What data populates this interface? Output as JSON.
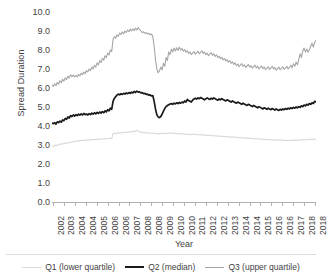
{
  "chart_data": {
    "type": "line",
    "title": "",
    "xlabel": "Year",
    "ylabel": "Spread Duration",
    "ylim": [
      0.0,
      10.0
    ],
    "ytick_labels": [
      "0.0",
      "1.0",
      "2.0",
      "3.0",
      "4.0",
      "5.0",
      "6.0",
      "7.0",
      "8.0",
      "9.0",
      "10.0"
    ],
    "ytick_values": [
      0.0,
      1.0,
      2.0,
      3.0,
      4.0,
      5.0,
      6.0,
      7.0,
      8.0,
      9.0,
      10.0
    ],
    "grid": false,
    "legend_position": "bottom",
    "xtick_labels": [
      "2002",
      "2003",
      "2004",
      "2004",
      "2005",
      "2006",
      "2006",
      "2007",
      "2008",
      "2008",
      "2009",
      "2010",
      "2010",
      "2011",
      "2012",
      "2012",
      "2013",
      "2014",
      "2014",
      "2015",
      "2016",
      "2016",
      "2017",
      "2018",
      "2018"
    ],
    "x_start": 2002.0,
    "x_end": 2018.6,
    "series": [
      {
        "name": "Q1 (lower quartile)",
        "color": "#d9d9d9",
        "width": 1.1,
        "values": [
          2.95,
          2.92,
          2.96,
          3.0,
          2.98,
          3.02,
          3.05,
          3.03,
          3.08,
          3.06,
          3.1,
          3.12,
          3.09,
          3.14,
          3.16,
          3.13,
          3.18,
          3.2,
          3.17,
          3.22,
          3.24,
          3.21,
          3.25,
          3.23,
          3.26,
          3.24,
          3.27,
          3.25,
          3.28,
          3.26,
          3.29,
          3.27,
          3.3,
          3.28,
          3.31,
          3.29,
          3.32,
          3.3,
          3.33,
          3.31,
          3.34,
          3.32,
          3.35,
          3.33,
          3.36,
          3.34,
          3.6,
          3.62,
          3.59,
          3.63,
          3.65,
          3.62,
          3.66,
          3.64,
          3.67,
          3.65,
          3.68,
          3.66,
          3.7,
          3.67,
          3.72,
          3.69,
          3.74,
          3.71,
          3.78,
          3.74,
          3.7,
          3.66,
          3.68,
          3.64,
          3.66,
          3.63,
          3.65,
          3.62,
          3.64,
          3.61,
          3.63,
          3.6,
          3.62,
          3.59,
          3.61,
          3.58,
          3.6,
          3.62,
          3.59,
          3.61,
          3.63,
          3.6,
          3.62,
          3.64,
          3.61,
          3.63,
          3.6,
          3.62,
          3.59,
          3.61,
          3.58,
          3.6,
          3.57,
          3.59,
          3.56,
          3.58,
          3.55,
          3.57,
          3.54,
          3.56,
          3.58,
          3.55,
          3.57,
          3.54,
          3.56,
          3.53,
          3.55,
          3.52,
          3.54,
          3.51,
          3.53,
          3.5,
          3.52,
          3.49,
          3.51,
          3.48,
          3.5,
          3.47,
          3.49,
          3.46,
          3.48,
          3.45,
          3.47,
          3.44,
          3.46,
          3.43,
          3.45,
          3.42,
          3.44,
          3.41,
          3.43,
          3.4,
          3.42,
          3.39,
          3.41,
          3.38,
          3.4,
          3.37,
          3.39,
          3.36,
          3.38,
          3.35,
          3.37,
          3.34,
          3.36,
          3.33,
          3.35,
          3.32,
          3.34,
          3.31,
          3.33,
          3.3,
          3.32,
          3.29,
          3.31,
          3.28,
          3.3,
          3.27,
          3.29,
          3.26,
          3.28,
          3.25,
          3.27,
          3.24,
          3.26,
          3.28,
          3.25,
          3.27,
          3.24,
          3.26,
          3.23,
          3.25,
          3.22,
          3.24,
          3.26,
          3.23,
          3.25,
          3.27,
          3.24,
          3.26,
          3.28,
          3.25,
          3.27,
          3.29,
          3.26,
          3.28,
          3.3,
          3.27,
          3.29,
          3.31,
          3.28,
          3.3,
          3.32,
          3.29
        ]
      },
      {
        "name": "Q2 (median)",
        "color": "#1a1a1a",
        "width": 1.7,
        "values": [
          4.15,
          4.12,
          4.18,
          4.1,
          4.22,
          4.18,
          4.26,
          4.2,
          4.32,
          4.28,
          4.4,
          4.35,
          4.48,
          4.42,
          4.55,
          4.5,
          4.58,
          4.52,
          4.6,
          4.55,
          4.62,
          4.57,
          4.64,
          4.58,
          4.66,
          4.6,
          4.63,
          4.58,
          4.65,
          4.6,
          4.68,
          4.62,
          4.7,
          4.64,
          4.72,
          4.66,
          4.74,
          4.68,
          4.76,
          4.7,
          4.8,
          4.74,
          4.86,
          4.8,
          4.94,
          4.88,
          5.3,
          5.45,
          5.55,
          5.62,
          5.68,
          5.64,
          5.7,
          5.66,
          5.72,
          5.68,
          5.74,
          5.7,
          5.76,
          5.72,
          5.78,
          5.74,
          5.82,
          5.76,
          5.84,
          5.78,
          5.8,
          5.74,
          5.76,
          5.7,
          5.72,
          5.66,
          5.68,
          5.62,
          5.64,
          5.58,
          5.6,
          5.3,
          4.9,
          4.6,
          4.48,
          4.44,
          4.5,
          4.62,
          4.78,
          4.92,
          5.02,
          5.08,
          5.12,
          5.16,
          5.18,
          5.14,
          5.2,
          5.16,
          5.22,
          5.18,
          5.24,
          5.2,
          5.26,
          5.22,
          5.32,
          5.26,
          5.4,
          5.34,
          5.3,
          5.26,
          5.36,
          5.42,
          5.46,
          5.42,
          5.48,
          5.44,
          5.5,
          5.46,
          5.42,
          5.38,
          5.44,
          5.48,
          5.44,
          5.4,
          5.46,
          5.42,
          5.48,
          5.44,
          5.4,
          5.36,
          5.42,
          5.38,
          5.44,
          5.4,
          5.36,
          5.32,
          5.38,
          5.34,
          5.3,
          5.26,
          5.32,
          5.28,
          5.24,
          5.2,
          5.26,
          5.22,
          5.18,
          5.14,
          5.2,
          5.16,
          5.12,
          5.08,
          5.14,
          5.1,
          5.06,
          5.02,
          5.08,
          5.04,
          5.0,
          4.96,
          5.02,
          4.98,
          4.94,
          4.9,
          4.96,
          4.92,
          4.88,
          4.94,
          4.9,
          4.86,
          4.92,
          4.88,
          4.84,
          4.9,
          4.86,
          4.82,
          4.88,
          4.84,
          4.9,
          4.86,
          4.92,
          4.88,
          4.94,
          4.9,
          4.96,
          4.92,
          4.98,
          4.94,
          5.0,
          4.96,
          5.02,
          4.98,
          5.06,
          5.02,
          5.1,
          5.06,
          5.14,
          5.1,
          5.18,
          5.14,
          5.22,
          5.18,
          5.3,
          5.26
        ]
      },
      {
        "name": "Q3 (upper quartile)",
        "color": "#a6a6a6",
        "width": 1.1,
        "values": [
          6.15,
          6.08,
          6.22,
          6.12,
          6.3,
          6.2,
          6.38,
          6.28,
          6.46,
          6.36,
          6.54,
          6.44,
          6.62,
          6.52,
          6.7,
          6.6,
          6.68,
          6.58,
          6.66,
          6.58,
          6.72,
          6.64,
          6.78,
          6.7,
          6.84,
          6.76,
          6.92,
          6.84,
          7.0,
          6.92,
          7.1,
          7.0,
          7.2,
          7.1,
          7.32,
          7.22,
          7.44,
          7.34,
          7.56,
          7.46,
          7.7,
          7.6,
          7.84,
          7.74,
          8.0,
          7.92,
          8.55,
          8.7,
          8.62,
          8.8,
          8.72,
          8.9,
          8.82,
          8.95,
          8.86,
          9.0,
          8.92,
          9.05,
          8.96,
          9.1,
          9.0,
          9.12,
          9.02,
          9.15,
          9.05,
          9.18,
          9.08,
          9.0,
          8.92,
          8.96,
          8.88,
          8.92,
          8.84,
          8.88,
          8.8,
          8.84,
          8.7,
          8.2,
          7.5,
          7.0,
          6.8,
          6.9,
          7.1,
          6.95,
          7.3,
          7.15,
          7.6,
          7.45,
          7.9,
          7.75,
          8.05,
          7.9,
          8.1,
          7.95,
          8.12,
          7.98,
          8.14,
          8.0,
          8.08,
          7.94,
          8.02,
          7.88,
          7.96,
          7.82,
          7.9,
          7.76,
          7.84,
          7.92,
          7.78,
          7.86,
          7.94,
          7.8,
          7.88,
          7.96,
          7.82,
          7.9,
          7.76,
          7.84,
          7.7,
          7.78,
          7.86,
          7.72,
          7.8,
          7.66,
          7.74,
          7.6,
          7.68,
          7.54,
          7.62,
          7.48,
          7.56,
          7.42,
          7.5,
          7.36,
          7.44,
          7.3,
          7.38,
          7.24,
          7.32,
          7.18,
          7.26,
          7.12,
          7.2,
          7.28,
          7.14,
          7.22,
          7.08,
          7.16,
          7.24,
          7.1,
          7.18,
          7.04,
          7.12,
          7.2,
          7.06,
          7.14,
          7.0,
          7.08,
          7.16,
          7.02,
          7.1,
          6.96,
          7.04,
          7.12,
          6.98,
          7.06,
          7.14,
          7.0,
          7.08,
          6.94,
          7.02,
          7.1,
          6.96,
          7.04,
          7.12,
          6.98,
          7.06,
          7.14,
          7.0,
          7.08,
          7.2,
          7.06,
          7.28,
          7.14,
          7.36,
          7.22,
          7.5,
          7.8,
          7.6,
          7.95,
          8.1,
          7.9,
          8.05,
          7.88,
          8.0,
          8.2,
          8.35,
          8.15,
          8.4,
          8.5
        ]
      }
    ]
  },
  "legend": {
    "items": [
      {
        "label": "Q1 (lower quartile)",
        "color": "#d9d9d9",
        "width": 1.1
      },
      {
        "label": "Q2 (median)",
        "color": "#1a1a1a",
        "width": 2.2
      },
      {
        "label": "Q3 (upper quartile)",
        "color": "#a6a6a6",
        "width": 1.1
      }
    ]
  }
}
